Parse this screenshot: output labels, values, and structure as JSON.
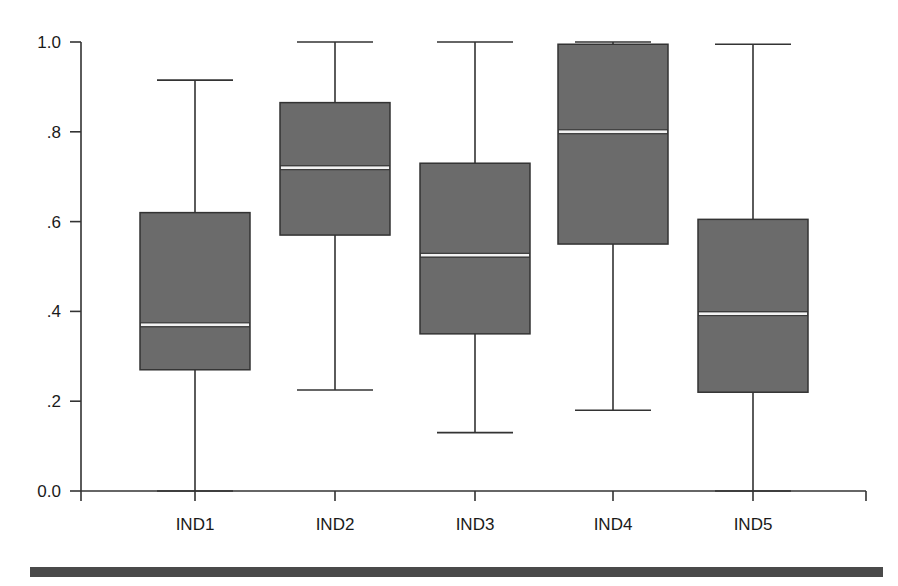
{
  "chart_data": {
    "type": "boxplot",
    "title": "",
    "xlabel": "",
    "ylabel": "",
    "ylim": [
      0.0,
      1.0
    ],
    "yticks": [
      0.0,
      0.2,
      0.4,
      0.6,
      0.8,
      1.0
    ],
    "ytick_labels": [
      "0.0",
      ".2",
      ".4",
      ".6",
      ".8",
      "1.0"
    ],
    "categories": [
      "IND1",
      "IND2",
      "IND3",
      "IND4",
      "IND5"
    ],
    "series": [
      {
        "name": "IND1",
        "whisker_low": 0.0,
        "q1": 0.27,
        "median": 0.37,
        "q3": 0.62,
        "whisker_high": 0.915
      },
      {
        "name": "IND2",
        "whisker_low": 0.225,
        "q1": 0.57,
        "median": 0.72,
        "q3": 0.865,
        "whisker_high": 1.0
      },
      {
        "name": "IND3",
        "whisker_low": 0.13,
        "q1": 0.35,
        "median": 0.525,
        "q3": 0.73,
        "whisker_high": 1.0
      },
      {
        "name": "IND4",
        "whisker_low": 0.18,
        "q1": 0.55,
        "median": 0.8,
        "q3": 0.995,
        "whisker_high": 1.0
      },
      {
        "name": "IND5",
        "whisker_low": 0.0,
        "q1": 0.22,
        "median": 0.395,
        "q3": 0.605,
        "whisker_high": 0.995
      }
    ],
    "grid": false,
    "legend": "none",
    "colors": {
      "box_fill": "#6b6b6b",
      "box_stroke": "#333333",
      "median": "#f2f2f2",
      "axis": "#333333",
      "rule": "#4a4a4a"
    }
  }
}
